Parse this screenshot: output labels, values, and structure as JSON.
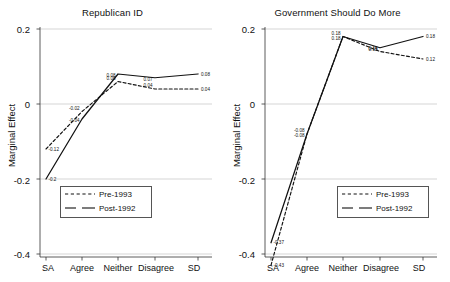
{
  "figure": {
    "ylabel": "Marginal Effect",
    "y_ticks": [
      "0.2",
      "0",
      "-0.2",
      "-0.4"
    ],
    "x_ticks": [
      "SA",
      "Agree",
      "Neither",
      "Disagree",
      "SD"
    ],
    "legend": {
      "pre_label": "Pre-1993",
      "post_label": "Post-1992"
    }
  },
  "chart_data": [
    {
      "type": "line",
      "title": "Republican ID",
      "xlabel": "",
      "ylabel": "Marginal Effect",
      "categories": [
        "SA",
        "Agree",
        "Neither",
        "Disagree",
        "SD"
      ],
      "ylim": [
        -0.45,
        0.22
      ],
      "yticks": [
        0.2,
        0,
        -0.2,
        -0.4
      ],
      "grid": true,
      "legend_position": "bottom-left",
      "series": [
        {
          "name": "Pre-1993",
          "style": "dashed",
          "values": [
            -0.12,
            -0.02,
            0.06,
            0.04,
            0.04
          ],
          "labels": [
            "-0.12",
            "-0.02",
            "0.06",
            "0.04",
            "0.04"
          ]
        },
        {
          "name": "Post-1992",
          "style": "solid",
          "values": [
            -0.2,
            -0.04,
            0.08,
            0.07,
            0.08
          ],
          "labels": [
            "-0.2",
            "-0.04",
            "0.08",
            "0.07",
            "0.08"
          ]
        }
      ]
    },
    {
      "type": "line",
      "title": "Government Should Do More",
      "xlabel": "",
      "ylabel": "Marginal Effect",
      "categories": [
        "SA",
        "Agree",
        "Neither",
        "Disagree",
        "SD"
      ],
      "ylim": [
        -0.45,
        0.22
      ],
      "yticks": [
        0.2,
        0,
        -0.2,
        -0.4
      ],
      "grid": true,
      "legend_position": "bottom-right",
      "series": [
        {
          "name": "Pre-1993",
          "style": "dashed",
          "values": [
            -0.43,
            -0.08,
            0.18,
            0.14,
            0.12
          ],
          "labels": [
            "-0.43",
            "-0.08",
            "0.18",
            "0.14",
            "0.12"
          ]
        },
        {
          "name": "Post-1992",
          "style": "solid",
          "values": [
            -0.37,
            -0.08,
            0.18,
            0.15,
            0.18
          ],
          "labels": [
            "-0.37",
            "-0.08",
            "0.18",
            "0.15",
            "0.18"
          ]
        }
      ]
    }
  ]
}
